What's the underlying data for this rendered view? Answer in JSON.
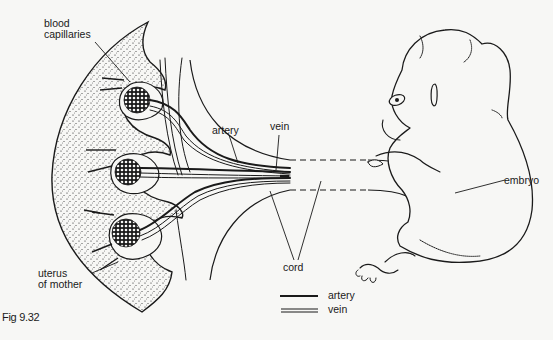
{
  "figure": {
    "caption": "Fig 9.32",
    "labels": {
      "blood_capillaries_line1": "blood",
      "blood_capillaries_line2": "capillaries",
      "artery": "artery",
      "vein": "vein",
      "embryo": "embryo",
      "cord": "cord",
      "uterus_line1": "uterus",
      "uterus_line2": "of mother"
    },
    "legend": [
      {
        "symbol": "single-line",
        "label": "artery"
      },
      {
        "symbol": "double-line",
        "label": "vein"
      }
    ],
    "colors": {
      "ink": "#1a1a1a",
      "paper": "#f7f7f5"
    }
  }
}
